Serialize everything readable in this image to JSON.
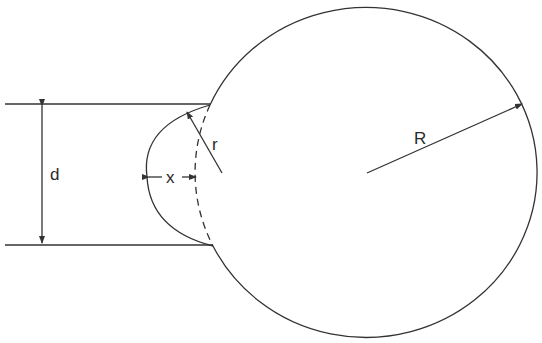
{
  "diagram": {
    "labels": {
      "d": "d",
      "x": "x",
      "r": "r",
      "R": "R"
    },
    "colors": {
      "stroke": "#333333",
      "background": "#ffffff"
    }
  }
}
